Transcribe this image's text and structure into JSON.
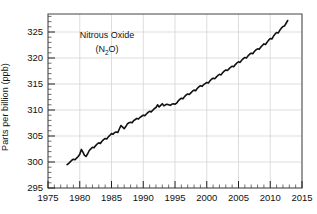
{
  "figure": {
    "background": "#ffffff",
    "line_color": "#111111",
    "grid_color": "#cfcfcf",
    "frame_color": "#555555"
  },
  "axes": {
    "ylabel": "Parts per billion (ppb)",
    "xlabel": "",
    "yticks": [
      "295",
      "300",
      "305",
      "310",
      "315",
      "320",
      "325"
    ],
    "xticks": [
      "1975",
      "1980",
      "1985",
      "1990",
      "1995",
      "2000",
      "2005",
      "2010",
      "2015"
    ]
  },
  "annotation": {
    "line1": "Nitrous Oxide",
    "formula_open": "(N",
    "formula_sub": "2",
    "formula_close": "O)"
  },
  "chart_data": {
    "type": "line",
    "title": "Nitrous Oxide (N2O)",
    "xlabel": "",
    "ylabel": "Parts per billion (ppb)",
    "xlim": [
      1975,
      2015
    ],
    "ylim": [
      295,
      327
    ],
    "grid": true,
    "legend": "none",
    "xticks": [
      1975,
      1980,
      1985,
      1990,
      1995,
      2000,
      2005,
      2010,
      2015
    ],
    "yticks": [
      295,
      300,
      305,
      310,
      315,
      320,
      325
    ],
    "series": [
      {
        "name": "Nitrous Oxide (N2O)",
        "units": "ppb",
        "color": "#111111",
        "x": [
          1978.0,
          1978.25,
          1978.5,
          1978.75,
          1979.0,
          1979.25,
          1979.5,
          1979.75,
          1980.0,
          1980.25,
          1980.5,
          1980.75,
          1981.0,
          1981.25,
          1981.5,
          1981.75,
          1982.0,
          1982.25,
          1982.5,
          1982.75,
          1983.0,
          1983.25,
          1983.5,
          1983.75,
          1984.0,
          1984.25,
          1984.5,
          1984.75,
          1985.0,
          1985.25,
          1985.5,
          1985.75,
          1986.0,
          1986.25,
          1986.5,
          1986.75,
          1987.0,
          1987.25,
          1987.5,
          1987.75,
          1988.0,
          1988.25,
          1988.5,
          1988.75,
          1989.0,
          1989.25,
          1989.5,
          1989.75,
          1990.0,
          1990.25,
          1990.5,
          1990.75,
          1991.0,
          1991.25,
          1991.5,
          1991.75,
          1992.0,
          1992.25,
          1992.5,
          1992.75,
          1993.0,
          1993.25,
          1993.5,
          1993.75,
          1994.0,
          1994.25,
          1994.5,
          1994.75,
          1995.0,
          1995.25,
          1995.5,
          1995.75,
          1996.0,
          1996.25,
          1996.5,
          1996.75,
          1997.0,
          1997.25,
          1997.5,
          1997.75,
          1998.0,
          1998.25,
          1998.5,
          1998.75,
          1999.0,
          1999.25,
          1999.5,
          1999.75,
          2000.0,
          2000.25,
          2000.5,
          2000.75,
          2001.0,
          2001.25,
          2001.5,
          2001.75,
          2002.0,
          2002.25,
          2002.5,
          2002.75,
          2003.0,
          2003.25,
          2003.5,
          2003.75,
          2004.0,
          2004.25,
          2004.5,
          2004.75,
          2005.0,
          2005.25,
          2005.5,
          2005.75,
          2006.0,
          2006.25,
          2006.5,
          2006.75,
          2007.0,
          2007.25,
          2007.5,
          2007.75,
          2008.0,
          2008.25,
          2008.5,
          2008.75,
          2009.0,
          2009.25,
          2009.5,
          2009.75,
          2010.0,
          2010.25,
          2010.5,
          2010.75,
          2011.0,
          2011.25,
          2011.5,
          2011.75,
          2012.0,
          2012.25,
          2012.5,
          2012.75
        ],
        "y": [
          299.3,
          299.5,
          299.8,
          300.1,
          300.3,
          300.2,
          300.5,
          300.8,
          301.2,
          302.1,
          301.6,
          301.0,
          300.8,
          301.3,
          301.9,
          302.2,
          302.5,
          302.4,
          302.8,
          303.1,
          303.3,
          303.2,
          303.6,
          303.9,
          304.1,
          304.0,
          304.4,
          304.7,
          305.0,
          304.9,
          305.2,
          305.3,
          305.2,
          305.9,
          306.5,
          306.2,
          305.9,
          306.3,
          306.8,
          307.0,
          307.1,
          307.0,
          307.4,
          307.6,
          307.8,
          307.7,
          308.0,
          308.2,
          308.4,
          308.3,
          308.6,
          308.9,
          309.1,
          309.0,
          309.3,
          309.6,
          309.8,
          310.3,
          309.9,
          310.2,
          310.5,
          310.1,
          310.3,
          310.4,
          310.3,
          310.2,
          310.4,
          310.5,
          310.4,
          310.6,
          311.0,
          311.3,
          311.5,
          311.4,
          311.8,
          312.1,
          312.3,
          312.2,
          312.5,
          312.8,
          313.0,
          312.9,
          313.3,
          313.6,
          313.8,
          313.7,
          314.0,
          314.2,
          314.4,
          314.3,
          314.7,
          315.0,
          315.2,
          315.1,
          315.4,
          315.7,
          315.9,
          315.8,
          316.2,
          316.5,
          316.7,
          316.6,
          316.9,
          317.2,
          317.4,
          317.3,
          317.7,
          318.0,
          318.2,
          318.1,
          318.5,
          318.8,
          319.0,
          318.9,
          319.3,
          319.6,
          319.8,
          319.7,
          320.1,
          320.4,
          320.6,
          320.5,
          320.9,
          321.2,
          321.5,
          321.4,
          321.8,
          322.2,
          322.5,
          322.4,
          322.9,
          323.3,
          323.6,
          323.5,
          324.0,
          324.4,
          324.7,
          324.8,
          325.3,
          325.8
        ],
        "start_value": 299.3,
        "end_value": 325.8
      }
    ]
  }
}
